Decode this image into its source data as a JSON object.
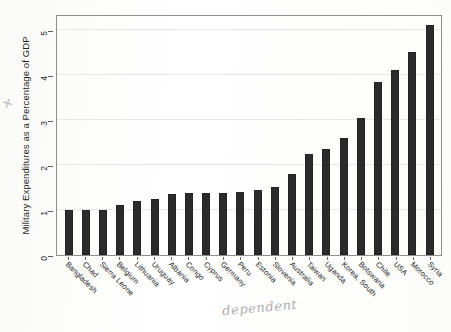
{
  "chart_data": {
    "type": "bar",
    "title": "",
    "xlabel": "",
    "ylabel": "Military Expenditures as a Percentage of GDP",
    "ylim": [
      0,
      5.35
    ],
    "yticks": [
      0,
      1,
      2,
      3,
      4,
      5
    ],
    "ytick_labels": [
      "0",
      "1",
      "2",
      "3",
      "4",
      "5"
    ],
    "grid": true,
    "legend": false,
    "bar_color": "#2b2b2b",
    "categories": [
      "Bangladesh",
      "Chad",
      "Sierra Leone",
      "Belgium",
      "Lithuania",
      "Uruguay",
      "Albania",
      "Congo",
      "Cyprus",
      "Germany",
      "Peru",
      "Estonia",
      "Slovenia",
      "Australia",
      "Taiwan",
      "Uganda",
      "Korea, South",
      "Botswana",
      "Chile",
      "USA",
      "Morocco",
      "Syria"
    ],
    "values": [
      1.0,
      1.0,
      1.0,
      1.1,
      1.2,
      1.25,
      1.35,
      1.38,
      1.38,
      1.38,
      1.4,
      1.45,
      1.5,
      1.8,
      2.25,
      2.35,
      2.6,
      3.05,
      3.85,
      4.1,
      4.5,
      5.1
    ]
  },
  "annotations": {
    "pencil_note": "dependent",
    "pencil_left_mark": "✕"
  }
}
